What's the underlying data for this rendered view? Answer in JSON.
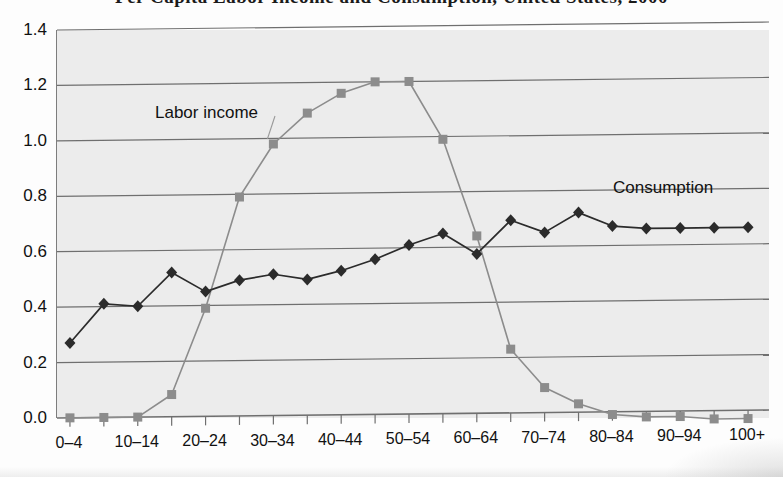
{
  "title": "Per Capita Labor Income and Consumption, United States, 2000",
  "axes": {
    "y_ticks": [
      "1.4",
      "1.2",
      "1.0",
      "0.8",
      "0.6",
      "0.4",
      "0.2",
      "0.0"
    ],
    "x_ticks_visible": [
      "0–4",
      "10–14",
      "20–24",
      "30–34",
      "40–44",
      "50–54",
      "60–64",
      "70–74",
      "80–84",
      "90–94",
      "100+"
    ],
    "ylim": [
      -0.06,
      1.4
    ],
    "ylabel": "",
    "xlabel": ""
  },
  "annotations": {
    "labor": "Labor income",
    "consumption": "Consumption"
  },
  "colors": {
    "labor_income": "#8c8c8c",
    "consumption": "#2b2b2b",
    "plot_background": "#ececec",
    "gridline": "#6f6f6f",
    "axis": "#7d7d7d"
  },
  "chart_data": {
    "type": "line",
    "title": "Per Capita Labor Income and Consumption, United States, 2000",
    "xlabel": "",
    "ylabel": "",
    "ylim": [
      -0.06,
      1.4
    ],
    "grid": true,
    "legend": "inline-annotations",
    "categories": [
      "0–4",
      "5–9",
      "10–14",
      "15–19",
      "20–24",
      "25–29",
      "30–34",
      "35–39",
      "40–44",
      "45–49",
      "50–54",
      "55–59",
      "60–64",
      "65–69",
      "70–74",
      "75–79",
      "80–84",
      "85–89",
      "90–94",
      "95–99",
      "100+"
    ],
    "series": [
      {
        "name": "Labor income",
        "marker": "square",
        "color": "#8c8c8c",
        "values": [
          0.0,
          0.0,
          0.0,
          0.08,
          0.39,
          0.79,
          0.98,
          1.09,
          1.16,
          1.2,
          1.2,
          0.99,
          0.64,
          0.23,
          0.09,
          0.03,
          -0.01,
          -0.02,
          -0.02,
          -0.03,
          -0.03
        ]
      },
      {
        "name": "Consumption",
        "marker": "diamond",
        "color": "#2b2b2b",
        "values": [
          0.27,
          0.41,
          0.4,
          0.52,
          0.45,
          0.49,
          0.51,
          0.49,
          0.52,
          0.56,
          0.61,
          0.65,
          0.575,
          0.695,
          0.65,
          0.72,
          0.67,
          0.66,
          0.66,
          0.66,
          0.66
        ]
      }
    ]
  }
}
